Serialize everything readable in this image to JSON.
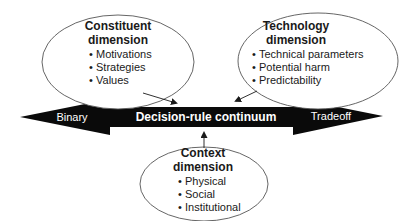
{
  "continuum": {
    "label": "Decision-rule continuum",
    "left_end": "Binary",
    "right_end": "Tradeoff"
  },
  "constituent": {
    "title_line1": "Constituent",
    "title_line2": "dimension",
    "items": [
      "Motivations",
      "Strategies",
      "Values"
    ]
  },
  "technology": {
    "title_line1": "Technology",
    "title_line2": "dimension",
    "items": [
      "Technical parameters",
      "Potential harm",
      "Predictability"
    ]
  },
  "context": {
    "title_line1": "Context",
    "title_line2": "dimension",
    "items": [
      "Physical",
      "Social",
      "Institutional"
    ]
  },
  "bullet": "•",
  "colors": {
    "arrow_fill": "#0a0a0a",
    "ellipse_stroke": "#555555",
    "text": "#1a1a1a"
  }
}
